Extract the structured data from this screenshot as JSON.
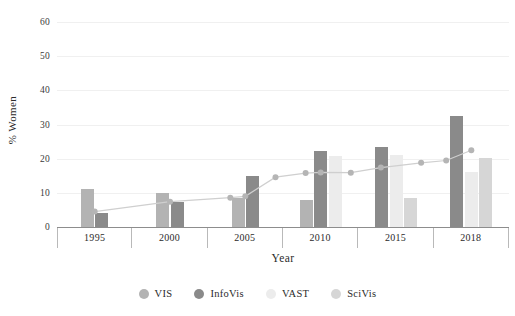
{
  "chart_data": {
    "type": "bar",
    "title": "",
    "xlabel": "Year",
    "ylabel": "% Women",
    "categories": [
      "1995",
      "2000",
      "2005",
      "2010",
      "2015",
      "2018"
    ],
    "ylim": [
      0,
      63
    ],
    "yticks": [
      0,
      10,
      20,
      30,
      40,
      50,
      60
    ],
    "grid": true,
    "legend_position": "bottom",
    "series": [
      {
        "name": "VIS",
        "color": "#b3b3b3",
        "values": [
          11.0,
          10.0,
          8.6,
          7.8,
          null,
          null
        ]
      },
      {
        "name": "InfoVis",
        "color": "#8a8a8a",
        "values": [
          4.0,
          7.4,
          15.0,
          22.2,
          23.5,
          32.4
        ]
      },
      {
        "name": "VAST",
        "color": "#ececec",
        "values": [
          null,
          null,
          null,
          20.8,
          21.2,
          16.0
        ]
      },
      {
        "name": "SciVis",
        "color": "#d6d6d6",
        "values": [
          null,
          null,
          null,
          null,
          8.4,
          20.2
        ]
      }
    ],
    "line_series": {
      "name": "overall",
      "color": "#c9c9c9",
      "marker_color": "#b5b5b5",
      "x": [
        1995,
        2000,
        2004,
        2005,
        2007,
        2009,
        2010,
        2012,
        2014,
        2016,
        2017,
        2018
      ],
      "values": [
        4.5,
        7.4,
        8.6,
        9.0,
        14.6,
        15.8,
        16.0,
        15.9,
        17.4,
        18.8,
        19.5,
        22.5
      ]
    }
  },
  "axis": {
    "ytick_labels": [
      "60",
      "50",
      "40",
      "30",
      "20",
      "10",
      "0"
    ],
    "ylabel": "% Women",
    "xlabel": "Year",
    "xtick_labels": [
      "1995",
      "2000",
      "2005",
      "2010",
      "2015",
      "2018"
    ]
  },
  "legend": {
    "items": [
      {
        "label": "VIS",
        "color": "#b3b3b3"
      },
      {
        "label": "InfoVis",
        "color": "#8a8a8a"
      },
      {
        "label": "VAST",
        "color": "#ececec"
      },
      {
        "label": "SciVis",
        "color": "#d6d6d6"
      }
    ]
  },
  "colors": {
    "gridline": "#f0f0f0",
    "axis": "#8d8d8d",
    "text": "#2b2b2b",
    "background": "#ffffff"
  }
}
